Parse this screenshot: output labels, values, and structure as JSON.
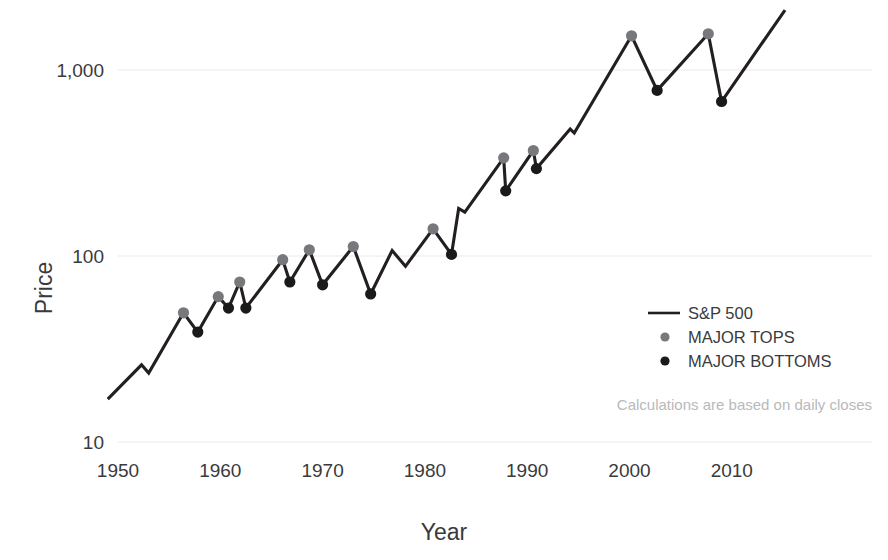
{
  "chart_data": {
    "type": "line",
    "title": "",
    "xlabel": "Year",
    "ylabel": "Price",
    "yscale": "log",
    "ylim": [
      10,
      2000
    ],
    "xlim": [
      1948.2,
      2015.5
    ],
    "grid": true,
    "ytick_labels": [
      "1,000",
      "100",
      "10"
    ],
    "ytick_values": [
      1000,
      100,
      10
    ],
    "xtick_labels": [
      "1950",
      "1960",
      "1970",
      "1980",
      "1990",
      "2000",
      "2010"
    ],
    "xtick_values": [
      1950,
      1960,
      1970,
      1980,
      1990,
      2000,
      2010
    ],
    "legend_position": "center-right",
    "legend": [
      {
        "name": "S&P 500",
        "marker": "line",
        "color": "#231f20"
      },
      {
        "name": "MAJOR TOPS",
        "marker": "dot",
        "color": "#77787b"
      },
      {
        "name": "MAJOR BOTTOMS",
        "marker": "dot",
        "color": "#1a1a1a"
      }
    ],
    "annotation": "Calculations are based on daily closes",
    "series": [
      {
        "name": "S&P 500",
        "x": [
          1949.0,
          1952.3,
          1953.0,
          1956.4,
          1957.8,
          1959.8,
          1960.8,
          1961.9,
          1962.5,
          1966.1,
          1966.8,
          1968.7,
          1970.0,
          1973.0,
          1974.7,
          1976.8,
          1978.1,
          1980.8,
          1982.6,
          1983.3,
          1983.9,
          1987.7,
          1987.9,
          1990.6,
          1990.9,
          1994.2,
          1994.6,
          2000.2,
          2002.7,
          2007.7,
          2009.0,
          2015.2
        ],
        "y": [
          17.0,
          26.0,
          23.5,
          49.5,
          39.0,
          60.5,
          52.5,
          72.5,
          52.5,
          95.5,
          72.5,
          108.0,
          70.0,
          112.5,
          62.5,
          107.0,
          88.0,
          140.0,
          102.0,
          180.0,
          172.0,
          337.0,
          224.0,
          369.0,
          295.0,
          482.0,
          458.0,
          1527.0,
          777.0,
          1565.0,
          677.0,
          2100.0
        ]
      }
    ],
    "major_tops": {
      "x": [
        1956.4,
        1959.8,
        1961.9,
        1966.1,
        1968.7,
        1973.0,
        1980.8,
        1987.7,
        1990.6,
        2000.2,
        2007.7
      ],
      "y": [
        49.5,
        60.5,
        72.5,
        95.5,
        108.0,
        112.5,
        140.0,
        337.0,
        369.0,
        1527.0,
        1565.0
      ]
    },
    "major_bottoms": {
      "x": [
        1957.8,
        1960.8,
        1962.5,
        1966.8,
        1970.0,
        1974.7,
        1982.6,
        1987.9,
        1990.9,
        2002.7,
        2009.0
      ],
      "y": [
        39.0,
        52.5,
        52.5,
        72.5,
        70.0,
        62.5,
        102.0,
        224.0,
        295.0,
        777.0,
        677.0
      ]
    }
  },
  "colors": {
    "line": "#231f20",
    "top_marker": "#77787b",
    "bottom_marker": "#1a1a1a",
    "grid": "#e9e9ea",
    "text": "#3a3a3c",
    "footnote": "#b9b9bb",
    "background": "#ffffff"
  }
}
